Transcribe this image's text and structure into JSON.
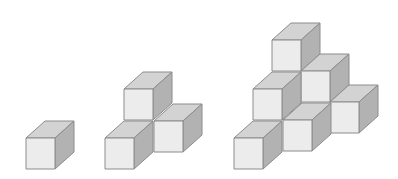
{
  "diagram": {
    "colors": {
      "background": "#ffffff",
      "front": "#ececec",
      "top": "#d3d3d3",
      "side": "#b2b2b2",
      "edge": "#8c8c8c"
    },
    "cube_geometry": {
      "width": 29,
      "height": 31,
      "depth_dx": 19,
      "depth_dy": -17
    },
    "figures": [
      {
        "name": "figure-1",
        "cube_count": 1,
        "cubes": [
          {
            "x": 26,
            "y": 138
          }
        ]
      },
      {
        "name": "figure-2",
        "cube_count": 4,
        "cubes": [
          {
            "x": 124,
            "y": 89
          },
          {
            "x": 105,
            "y": 138
          },
          {
            "x": 154,
            "y": 121
          }
        ]
      },
      {
        "name": "figure-3",
        "cube_count": 10,
        "cubes": [
          {
            "x": 272,
            "y": 40
          },
          {
            "x": 301,
            "y": 71
          },
          {
            "x": 253,
            "y": 89
          },
          {
            "x": 330,
            "y": 102
          },
          {
            "x": 283,
            "y": 120
          },
          {
            "x": 234,
            "y": 138
          }
        ]
      }
    ]
  }
}
